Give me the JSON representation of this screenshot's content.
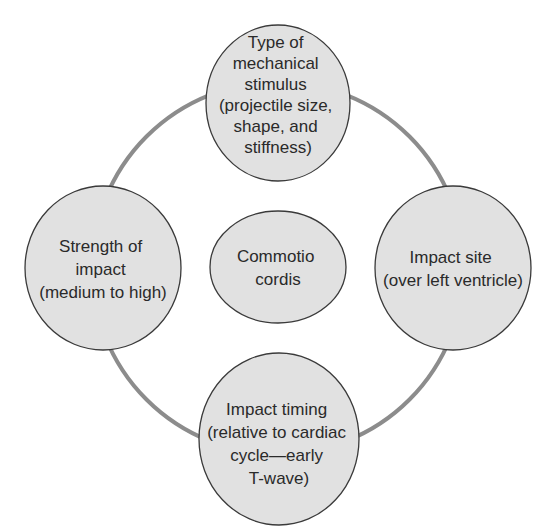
{
  "diagram": {
    "colors": {
      "ring": "#8c8c8c",
      "node_fill": "#e1e1e1",
      "node_stroke": "#3a3a3a",
      "text": "#2a2a2a"
    },
    "center": {
      "id": "commotio-cordis",
      "lines": [
        "Commotio",
        "cordis"
      ]
    },
    "nodes": [
      {
        "id": "type-of-mechanical-stimulus",
        "position": "top",
        "lines": [
          "Type of",
          "mechanical",
          "stimulus",
          "(projectile size,",
          "shape, and",
          "stiffness)"
        ]
      },
      {
        "id": "strength-of-impact",
        "position": "left",
        "lines": [
          "Strength of",
          "impact",
          "(medium to high)"
        ]
      },
      {
        "id": "impact-site",
        "position": "right",
        "lines": [
          "Impact site",
          "(over left ventricle)"
        ]
      },
      {
        "id": "impact-timing",
        "position": "bottom",
        "lines": [
          "Impact timing",
          "(relative to cardiac",
          "cycle—early",
          "T-wave)"
        ]
      }
    ]
  }
}
